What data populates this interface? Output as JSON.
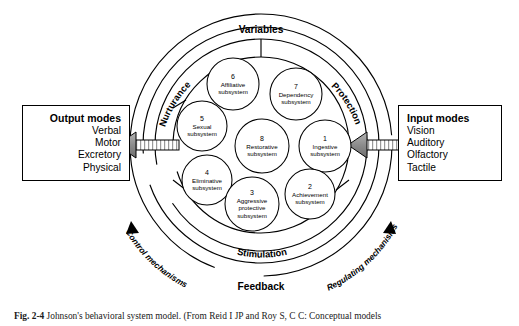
{
  "figure": {
    "caption_label": "Fig. 2-4",
    "caption_text": "Johnson's behavioral system model. (From Reid I JP and Roy S, C C: Conceptual models"
  },
  "output_box": {
    "title": "Output modes",
    "items": [
      "Verbal",
      "Motor",
      "Excretory",
      "Physical"
    ]
  },
  "input_box": {
    "title": "Input modes",
    "items": [
      "Vision",
      "Auditory",
      "Olfactory",
      "Tactile"
    ]
  },
  "ring_labels": {
    "top": "Variables",
    "upper_left": "Nurturance",
    "upper_right": "Protection",
    "bottom": "Stimulation",
    "feedback": "Feedback",
    "left_outer": "Control mechanisms",
    "right_outer": "Regulating mechanisms"
  },
  "subsystems": [
    {
      "number": "6",
      "name_line1": "Affiliative",
      "name_line2": "subsystem",
      "cx": 233,
      "cy": 84,
      "r": 26
    },
    {
      "number": "7",
      "name_line1": "Dependency",
      "name_line2": "subsystem",
      "cx": 296,
      "cy": 94,
      "r": 26
    },
    {
      "number": "5",
      "name_line1": "Sexual",
      "name_line2": "subsystem",
      "cx": 202,
      "cy": 126,
      "r": 25
    },
    {
      "number": "8",
      "name_line1": "Restorative",
      "name_line2": "subsystem",
      "cx": 262,
      "cy": 146,
      "r": 27
    },
    {
      "number": "1",
      "name_line1": "Ingestive",
      "name_line2": "subsystem",
      "cx": 325,
      "cy": 146,
      "r": 26
    },
    {
      "number": "4",
      "name_line1": "Eliminative",
      "name_line2": "subsystem",
      "cx": 207,
      "cy": 180,
      "r": 25
    },
    {
      "number": "3",
      "name_line1": "Aggressive",
      "name_line2": "protective",
      "name_line3": "subsystem",
      "cx": 252,
      "cy": 204,
      "r": 27
    },
    {
      "number": "2",
      "name_line1": "Achievement",
      "name_line2": "subsystem",
      "cx": 310,
      "cy": 194,
      "r": 25
    }
  ],
  "colors": {
    "stroke": "#000000",
    "arrow_fill": "#8c8c8c",
    "background": "#ffffff"
  }
}
